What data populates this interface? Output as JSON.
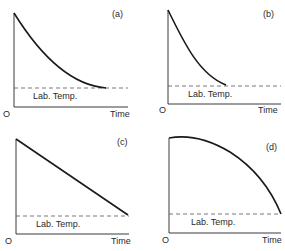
{
  "chart_data": [
    {
      "type": "line",
      "panel": "(a)",
      "title": "(a)",
      "xlabel": "Time",
      "origin_label": "O",
      "reference_line_label": "Lab. Temp.",
      "description": "Exponential-like decay of temperature approaching lab temperature asymptotically",
      "x": [
        0,
        0.1,
        0.2,
        0.3,
        0.4,
        0.5,
        0.6,
        0.7,
        0.8,
        0.9,
        1.0
      ],
      "values": [
        1.0,
        0.8,
        0.63,
        0.49,
        0.37,
        0.27,
        0.19,
        0.12,
        0.07,
        0.03,
        0.0
      ],
      "reference_value": 0.0,
      "geometry": {
        "x0": 14,
        "y_top": 13,
        "y_axis_bottom": 107,
        "x_axis_end": 128,
        "y_ref": 88,
        "curve_end_x": 106,
        "path": "M14,13 C40,55 70,85 106,88",
        "time_x": 110,
        "time_y": 117,
        "o_x": 3,
        "o_y": 117,
        "lab_x": 33,
        "lab_y": 99,
        "label_x": 112,
        "label_y": 17
      }
    },
    {
      "type": "line",
      "panel": "(b)",
      "title": "(b)",
      "xlabel": "Time",
      "origin_label": "O",
      "reference_line_label": "Lab. Temp.",
      "description": "Faster decay reaching lab temperature sooner",
      "x": [
        0,
        0.1,
        0.2,
        0.3,
        0.4,
        0.5,
        0.55
      ],
      "values": [
        1.0,
        0.72,
        0.48,
        0.28,
        0.12,
        0.02,
        0.0
      ],
      "reference_value": 0.0,
      "geometry": {
        "x0": 168,
        "y_top": 10,
        "y_axis_bottom": 104,
        "x_axis_end": 281,
        "y_ref": 86,
        "curve_end_x": 226,
        "path": "M168,10 C185,45 200,75 226,85",
        "time_x": 258,
        "time_y": 113,
        "o_x": 159,
        "o_y": 113,
        "lab_x": 188,
        "lab_y": 97,
        "label_x": 263,
        "label_y": 17
      }
    },
    {
      "type": "line",
      "panel": "(c)",
      "title": "(c)",
      "xlabel": "Time",
      "origin_label": "O",
      "reference_line_label": "Lab. Temp.",
      "description": "Linear decrease of temperature reaching lab temperature",
      "x": [
        0,
        1.0
      ],
      "values": [
        1.0,
        0.0
      ],
      "reference_value": 0.0,
      "geometry": {
        "x0": 16,
        "y_top": 139,
        "y_axis_bottom": 234,
        "x_axis_end": 129,
        "y_ref": 216,
        "curve_end_x": 128,
        "path": "M16,139 L128,215",
        "time_x": 111,
        "time_y": 244,
        "o_x": 5,
        "o_y": 244,
        "lab_x": 36,
        "lab_y": 227,
        "label_x": 117,
        "label_y": 145
      }
    },
    {
      "type": "line",
      "panel": "(d)",
      "title": "(d)",
      "xlabel": "Time",
      "origin_label": "O",
      "reference_line_label": "Lab. Temp.",
      "description": "Slow initial decrease then accelerating drop to lab temperature",
      "x": [
        0,
        0.2,
        0.4,
        0.6,
        0.8,
        1.0
      ],
      "values": [
        1.0,
        0.98,
        0.92,
        0.78,
        0.52,
        0.0
      ],
      "reference_value": 0.0,
      "geometry": {
        "x0": 169,
        "y_top": 138,
        "y_axis_bottom": 233,
        "x_axis_end": 281,
        "y_ref": 214,
        "curve_end_x": 281,
        "path": "M169,138 C185,135 205,137 230,152 C258,170 272,192 281,214",
        "time_x": 262,
        "time_y": 243,
        "o_x": 162,
        "o_y": 243,
        "lab_x": 191,
        "lab_y": 225,
        "label_x": 266,
        "label_y": 150
      }
    }
  ]
}
